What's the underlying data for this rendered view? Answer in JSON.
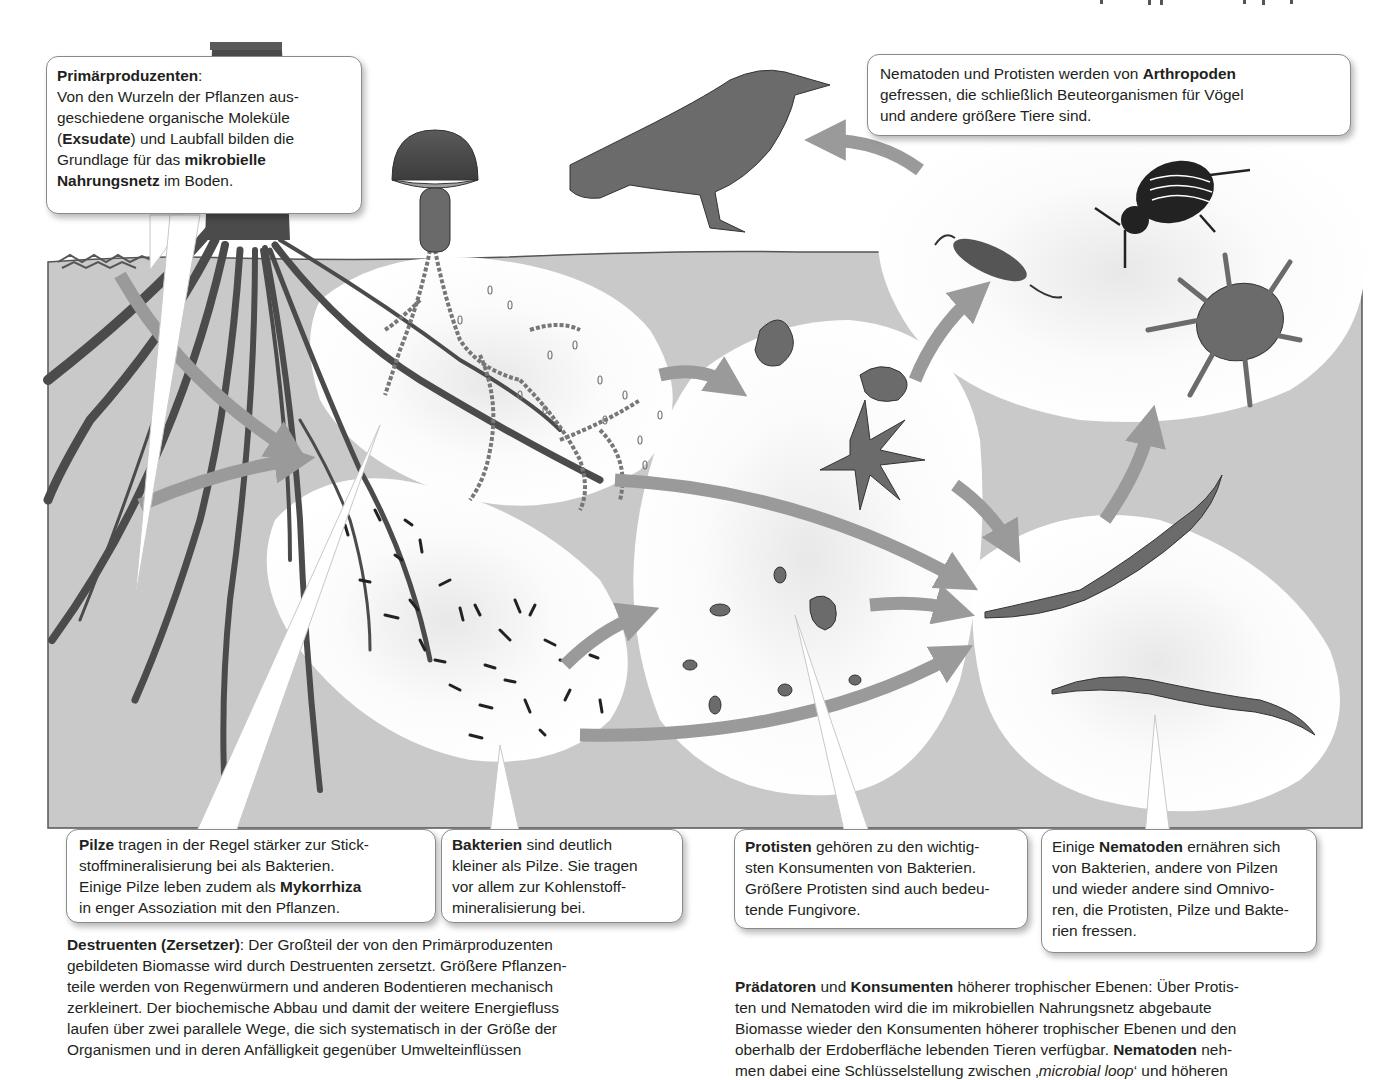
{
  "figure": {
    "colors": {
      "soil": "#c9c9c9",
      "root": "#4b4b4b",
      "arrow": "#9a9a9a",
      "organism": "#6b6b6b",
      "blob": "#ffffff",
      "callout_border": "#8a8a8a",
      "text": "#231f20"
    },
    "organisms": [
      "plant-root",
      "mushroom",
      "fungal-hyphae",
      "bacteria",
      "protists",
      "nematodes",
      "springtail",
      "beetle",
      "mite",
      "bird"
    ]
  },
  "callouts": {
    "primaerproduzenten": {
      "title": "Primärproduzenten",
      "title_suffix": ":",
      "l1": "Von den Wurzeln der Pflanzen aus-",
      "l2": "geschiedene organische Moleküle",
      "l3_open": "(",
      "l3_bold": "Exsudate",
      "l3_rest": ") und Laubfall bilden die",
      "l4_pre": "Grundlage für das ",
      "l4_bold": "mikrobielle",
      "l5_bold": "Nahrungsnetz",
      "l5_rest": " im Boden."
    },
    "arthropoden": {
      "l1_pre": "Nematoden und Protisten werden von ",
      "l1_bold": "Arthropoden",
      "l2": "gefressen, die schließlich Beuteorganismen für Vögel",
      "l3": "und andere größere Tiere sind."
    },
    "pilze": {
      "l1_bold": "Pilze",
      "l1_rest": " tragen in der Regel stärker zur Stick-",
      "l2": "stoffmineralisierung bei als Bakterien.",
      "l3_pre": "Einige Pilze leben zudem als ",
      "l3_bold": "Mykorrhiza",
      "l4": "in enger Assoziation mit den Pflanzen."
    },
    "bakterien": {
      "l1_bold": "Bakterien",
      "l1_rest": " sind deutlich",
      "l2": "kleiner als Pilze. Sie tragen",
      "l3": "vor allem zur Kohlenstoff-",
      "l4": "mineralisierung bei."
    },
    "protisten": {
      "l1_bold": "Protisten",
      "l1_rest": " gehören zu den wichtig-",
      "l2": "sten Konsumenten von Bakterien.",
      "l3": "Größere Protisten sind auch bedeu-",
      "l4": "tende Fungivore."
    },
    "nematoden": {
      "l1_pre": "Einige ",
      "l1_bold": "Nematoden",
      "l1_rest": " ernähren sich",
      "l2": "von Bakterien, andere von Pilzen",
      "l3": "und wieder andere sind Omnivo-",
      "l4": "ren, die Protisten, Pilze und Bakte-",
      "l5": "rien fressen."
    }
  },
  "paragraphs": {
    "destruenten": {
      "l1_bold": "Destruenten (Zersetzer)",
      "l1_rest": ": Der Großteil der von den Primärproduzenten",
      "l2": "gebildeten Biomasse wird durch Destruenten zersetzt. Größere Pflanzen-",
      "l3": "teile werden von Regenwürmern und anderen Bodentieren mechanisch",
      "l4": "zerkleinert. Der biochemische Abbau und damit der weitere Energiefluss",
      "l5": "laufen über zwei parallele Wege, die sich systematisch in der Größe der",
      "l6": "Organismen und in deren Anfälligkeit gegenüber Umwelteinflüssen"
    },
    "praedatoren": {
      "l1_bold_a": "Prädatoren",
      "l1_mid": " und ",
      "l1_bold_b": "Konsumenten",
      "l1_rest": " höherer trophischer Ebenen: Über Protis-",
      "l2": "ten und Nematoden wird die im mikrobiellen Nahrungsnetz abgebaute",
      "l3": "Biomasse wieder den Konsumenten höherer trophischer Ebenen und den",
      "l4_pre": "oberhalb der Erdoberfläche lebenden Tieren verfügbar. ",
      "l4_bold": "Nematoden",
      "l4_rest": " neh-",
      "l5_pre": "men dabei eine Schlüsselstellung zwischen ‚",
      "l5_italic": "microbial loop",
      "l5_rest": "‘ und höheren"
    }
  }
}
